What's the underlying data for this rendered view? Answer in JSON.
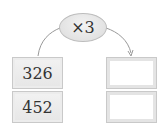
{
  "operation": {
    "label": "×3",
    "symbol": "×",
    "factor": 3
  },
  "inputs": [
    "326",
    "452"
  ],
  "outputs": [
    "",
    ""
  ],
  "colors": {
    "ellipse_fill": "#e2e2e2",
    "cell_border": "#c9c9c9",
    "line": "#999999"
  }
}
